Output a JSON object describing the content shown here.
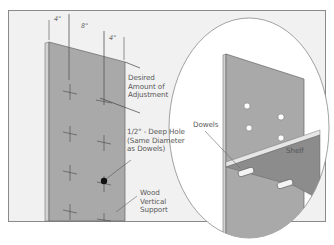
{
  "figure": {
    "colors": {
      "frame_bg": "#f1f1f1",
      "frame_border": "#8a8a8a",
      "board": "#a9a9a9",
      "board_edge": "#cfcfcf",
      "shelf": "#8c8c8c",
      "ellipse_bg": "#ffffff",
      "line": "#555555",
      "text": "#5a5a5a"
    }
  },
  "dimensions": {
    "left": "4\"",
    "middle": "8\"",
    "right": "4\""
  },
  "labels": {
    "adjustment": "Desired\nAmount of\nAdjustment",
    "hole": "1/2\" - Deep Hole\n(Same Diameter\nas Dowels)",
    "support": "Wood\nVertical\nSupport",
    "dowels": "Dowels",
    "shelf": "Shelf"
  }
}
